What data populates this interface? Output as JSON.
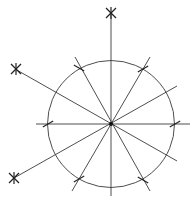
{
  "diagram": {
    "type": "geometric-construction",
    "colors": {
      "line": "#3a3a3a",
      "mark": "#222222",
      "background": "#ffffff"
    },
    "center": {
      "x": 111,
      "y": 124
    },
    "circle": {
      "cx": 111,
      "cy": 124,
      "r": 63.5
    },
    "lines": [
      {
        "name": "vertical-axis",
        "x1": 111,
        "y1": 12,
        "x2": 111,
        "y2": 196
      },
      {
        "name": "horizontal-axis",
        "x1": 36,
        "y1": 124,
        "x2": 190,
        "y2": 124
      },
      {
        "name": "line-30-degrees",
        "x1": 14,
        "y1": 178,
        "x2": 177,
        "y2": 86
      },
      {
        "name": "line-minus-30-degrees",
        "x1": 15,
        "y1": 69,
        "x2": 177,
        "y2": 161
      },
      {
        "name": "line-60-degrees",
        "x1": 72,
        "y1": 191,
        "x2": 150,
        "y2": 57
      },
      {
        "name": "line-minus-60-degrees",
        "x1": 75,
        "y1": 57,
        "x2": 150,
        "y2": 191
      }
    ],
    "asterisk_marks": [
      {
        "name": "top-asterisk",
        "x": 111,
        "y": 13
      },
      {
        "name": "upper-left-asterisk",
        "x": 16,
        "y": 69
      },
      {
        "name": "lower-left-asterisk",
        "x": 14,
        "y": 178
      }
    ],
    "tick_marks": [
      {
        "name": "tick-left",
        "x": 48,
        "y": 124,
        "angle": -30
      },
      {
        "name": "tick-right",
        "x": 175,
        "y": 124,
        "angle": -30
      },
      {
        "name": "tick-upper-left",
        "x": 79,
        "y": 68,
        "angle": 30
      },
      {
        "name": "tick-upper-right",
        "x": 143,
        "y": 69,
        "angle": -30
      },
      {
        "name": "tick-lower-left",
        "x": 79,
        "y": 179,
        "angle": -30
      },
      {
        "name": "tick-lower-right",
        "x": 143,
        "y": 180,
        "angle": 30
      }
    ]
  }
}
